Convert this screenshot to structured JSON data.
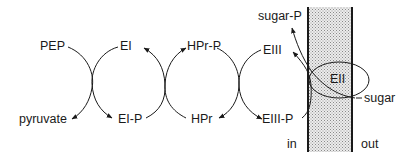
{
  "diagram": {
    "title": "",
    "colors": {
      "stroke": "#1a1a1a",
      "membrane_fill": "#d9d9d9",
      "background": "#ffffff"
    },
    "nodes": {
      "pep": "PEP",
      "pyruvate": "pyruvate",
      "ei": "EI",
      "ei_p": "EI-P",
      "hpr_p": "HPr-P",
      "hpr": "HPr",
      "eiii": "EIII",
      "eiii_p": "EIII-P",
      "eii": "EII",
      "sugar": "sugar",
      "sugar_p": "sugar-P"
    },
    "compartments": {
      "inside": "in",
      "outside": "out"
    },
    "reactions": [
      {
        "from": "PEP",
        "to": "pyruvate",
        "coupled_from": "EI",
        "coupled_to": "EI-P"
      },
      {
        "from": "EI-P",
        "to": "EI",
        "coupled_from": "HPr",
        "coupled_to": "HPr-P"
      },
      {
        "from": "HPr-P",
        "to": "HPr",
        "coupled_from": "EIII",
        "coupled_to": "EIII-P"
      },
      {
        "from": "EIII-P",
        "to": "EIII",
        "coupled_from": "sugar",
        "coupled_to": "sugar-P",
        "via": "EII"
      }
    ]
  }
}
